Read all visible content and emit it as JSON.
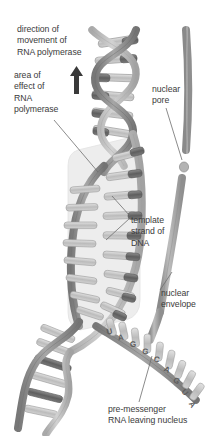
{
  "figure": {
    "type": "biological-diagram"
  },
  "labels": {
    "direction_of_movement": "direction of\nmovement of\nRNA polymerase",
    "area_of_effect": "area of\neffect of\nRNA\npolymerase",
    "nuclear_pore": "nuclear\npore",
    "template_strand": "template\nstrand of\nDNA",
    "nuclear_envelope": "nuclear\nenvelope",
    "pre_messenger_rna": "pre-messenger\nRNA leaving nucleus"
  },
  "rna_sequence": {
    "bases": [
      "U",
      "A",
      "G",
      "G",
      "C",
      "A",
      "G",
      "U",
      "A"
    ],
    "description": "pre-messenger RNA bases transcribed along the new strand"
  },
  "icons": {
    "direction_arrow": "up-arrow-icon"
  },
  "colors": {
    "backbone_dark": "#8c8c8c",
    "backbone_light": "#b8b8b8",
    "rung_dark": "#6f6f6f",
    "rung_light": "#c9c9c9",
    "highlight_area": "#ececec",
    "envelope": "#9a9a9a",
    "text": "#3b3b3b",
    "leader_line": "#6d6d6d",
    "background": "#ffffff"
  }
}
